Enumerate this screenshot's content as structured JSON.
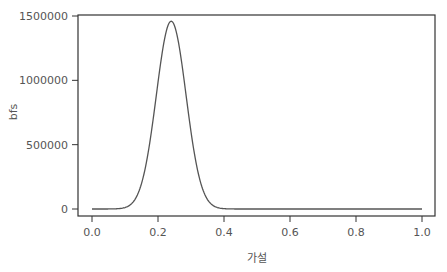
{
  "chart_data": {
    "type": "line",
    "title": "",
    "xlabel": "가설",
    "ylabel": "bfs",
    "xlim": [
      0.0,
      1.0
    ],
    "ylim": [
      0,
      1500000
    ],
    "x_ticks": [
      "0.0",
      "0.2",
      "0.4",
      "0.6",
      "0.8",
      "1.0"
    ],
    "y_ticks": [
      "0",
      "500000",
      "1000000",
      "1500000"
    ],
    "grid": false,
    "legend": null,
    "series": [
      {
        "name": "bfs",
        "color": "#555555",
        "peak": {
          "x": 0.24,
          "y": 1460000
        },
        "x": [
          0.0,
          0.05,
          0.1,
          0.12,
          0.14,
          0.16,
          0.18,
          0.2,
          0.22,
          0.24,
          0.26,
          0.28,
          0.3,
          0.32,
          0.34,
          0.36,
          0.38,
          0.4,
          0.45,
          0.5,
          0.6,
          0.7,
          0.8,
          0.9,
          1.0
        ],
        "values": [
          0,
          0,
          9000,
          40000,
          125000,
          300000,
          590000,
          960000,
          1310000,
          1460000,
          1310000,
          960000,
          590000,
          300000,
          125000,
          40000,
          9000,
          3000,
          0,
          0,
          0,
          0,
          0,
          0,
          0
        ]
      }
    ]
  }
}
